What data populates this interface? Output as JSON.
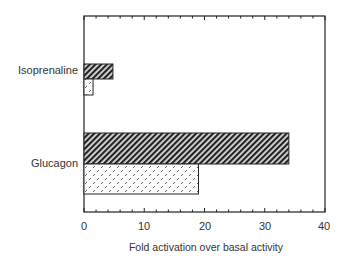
{
  "chart_data": {
    "type": "bar",
    "orientation": "horizontal",
    "title": "",
    "xlabel": "Fold activation over basal activity",
    "ylabel": "",
    "xlim": [
      0,
      40
    ],
    "x_ticks": [
      0,
      10,
      20,
      30,
      40
    ],
    "x_tick_labels": [
      "0",
      "10",
      "20",
      "30",
      "40"
    ],
    "minor_tick_step": 2,
    "grid": false,
    "categories": [
      "Isoprenaline",
      "Glucagon"
    ],
    "series": [
      {
        "name": "Diagonal hatched",
        "pattern": "diagonal-hatch",
        "values": [
          4.8,
          34
        ]
      },
      {
        "name": "Dotted",
        "pattern": "dotted",
        "values": [
          1.5,
          19
        ]
      }
    ],
    "legend": null
  },
  "labels": {
    "cat0": "Isoprenaline",
    "cat1": "Glucagon",
    "xlabel": "Fold activation over basal activity",
    "t0": "0",
    "t10": "10",
    "t20": "20",
    "t30": "30",
    "t40": "40"
  }
}
